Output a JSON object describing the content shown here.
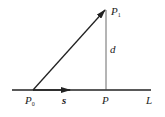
{
  "diagram": {
    "labels": {
      "p1": "P",
      "p1_sub": "1",
      "p0": "P",
      "p0_sub": "0",
      "p": "P",
      "s": "s",
      "d": "d",
      "l": "L"
    },
    "colors": {
      "stroke": "#222222",
      "background": "#ffffff"
    }
  }
}
